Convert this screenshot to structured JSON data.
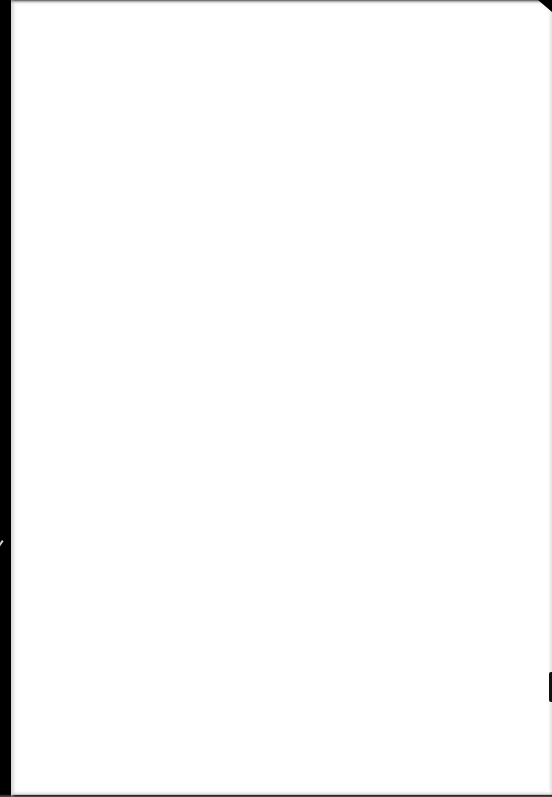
{
  "scene": {
    "description": "Photograph of a blank white sheet of paper on a dark background",
    "paper_color": "#ffffff",
    "background_color": "#000000",
    "text_content": []
  }
}
